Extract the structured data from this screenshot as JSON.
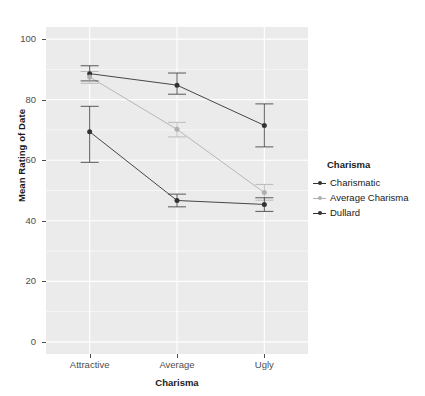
{
  "chart_data": {
    "type": "line",
    "title": "",
    "subtitle": "",
    "xlabel": "Charisma",
    "ylabel": "Mean Rating of Date",
    "categories": [
      "Attractive",
      "Average",
      "Ugly"
    ],
    "xticks": [
      "Attractive",
      "Average",
      "Ugly"
    ],
    "yticks": [
      0,
      20,
      40,
      60,
      80,
      100
    ],
    "ylim": [
      -4,
      104
    ],
    "grid": true,
    "grid_style": "white gridlines on grey panel",
    "legend_position": "right",
    "legend_title": "Charisma",
    "errorbars": true,
    "series": [
      {
        "name": "Charismatic",
        "color": "#333333",
        "values": [
          88.6,
          84.8,
          71.5
        ],
        "err_low": [
          86.2,
          81.8,
          64.4
        ],
        "err_high": [
          91.2,
          88.8,
          78.6
        ]
      },
      {
        "name": "Average Charisma",
        "color": "#b0b0b0",
        "values": [
          87.5,
          70.2,
          49.3
        ],
        "err_low": [
          85.4,
          67.7,
          46.8
        ],
        "err_high": [
          89.3,
          72.5,
          52.0
        ]
      },
      {
        "name": "Dullard",
        "color": "#333333",
        "values": [
          69.4,
          46.7,
          45.4
        ],
        "err_low": [
          59.3,
          44.6,
          43.1
        ],
        "err_high": [
          77.8,
          48.8,
          47.6
        ]
      }
    ]
  },
  "axes": {
    "y_label": "Mean Rating of Date",
    "x_label": "Charisma",
    "y_tick_labels": [
      "100",
      "80",
      "60",
      "40",
      "20",
      "0"
    ],
    "x_tick_labels": [
      "Attractive",
      "Average",
      "Ugly"
    ]
  },
  "legend": {
    "title": "Charisma",
    "items": [
      {
        "label": "Charismatic",
        "color": "#333333"
      },
      {
        "label": "Average Charisma",
        "color": "#b0b0b0"
      },
      {
        "label": "Dullard",
        "color": "#333333"
      }
    ]
  },
  "colors": {
    "panel_background": "#ebebeb",
    "page_background": "#ffffff",
    "gridline": "#ffffff",
    "axis_text": "#4d4d4d",
    "label_text": "#1a1a1a",
    "series_dark": "#333333",
    "series_light": "#b0b0b0"
  }
}
